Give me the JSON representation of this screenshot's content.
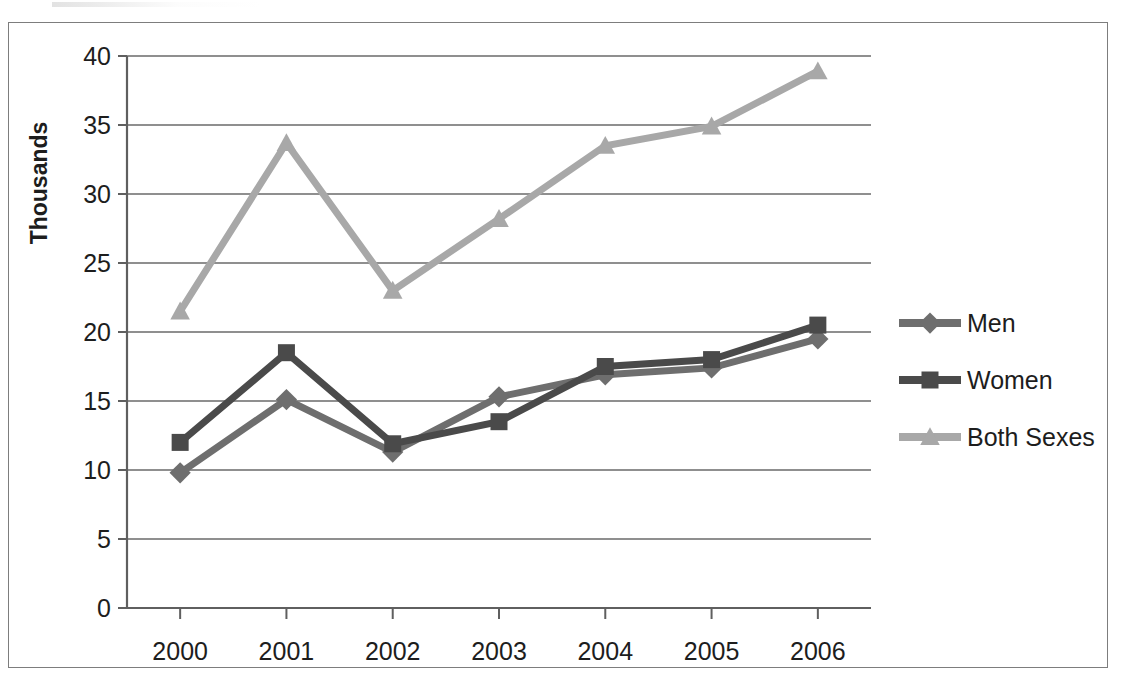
{
  "chart_data": {
    "type": "line",
    "title": "",
    "xlabel": "",
    "ylabel": "Thousands",
    "categories": [
      "2000",
      "2001",
      "2002",
      "2003",
      "2004",
      "2005",
      "2006"
    ],
    "ylim": [
      0,
      40
    ],
    "ytick_labels": [
      "40",
      "35",
      "30",
      "25",
      "20",
      "15",
      "10",
      "5",
      "0"
    ],
    "ytick_values": [
      40,
      35,
      30,
      25,
      20,
      15,
      10,
      5,
      0
    ],
    "grid": true,
    "legend_position": "right",
    "series": [
      {
        "name": "Men",
        "marker": "diamond",
        "color": "#6e6e6e",
        "values": [
          9.8,
          15.1,
          11.3,
          15.3,
          16.9,
          17.4,
          19.5
        ]
      },
      {
        "name": "Women",
        "marker": "square",
        "color": "#4a4a4a",
        "values": [
          12.0,
          18.5,
          11.9,
          13.5,
          17.5,
          18.0,
          20.5
        ]
      },
      {
        "name": "Both Sexes",
        "marker": "triangle",
        "color": "#a8a8a8",
        "values": [
          21.5,
          33.7,
          23.0,
          28.2,
          33.5,
          34.9,
          38.9
        ]
      }
    ]
  },
  "colors": {
    "men": "#6e6e6e",
    "women": "#4a4a4a",
    "both_sexes": "#a8a8a8",
    "axis": "#5f5f5f",
    "grid": "#6a6a6a",
    "border": "#7d7d7d",
    "text": "#1d1d1d"
  }
}
